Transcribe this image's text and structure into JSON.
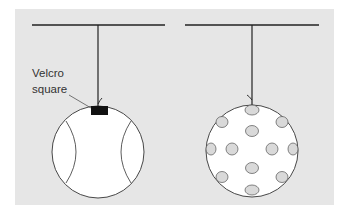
{
  "diagram": {
    "title": "",
    "panels": [
      {
        "name": "tennis-ball-pendulum",
        "ball": "tennis ball with seam curves",
        "annotation": {
          "line1": "Velcro",
          "line2": "square"
        }
      },
      {
        "name": "wiffle-ball-pendulum",
        "ball": "ball with oval holes"
      }
    ],
    "colors": {
      "background": "#e6e6e6",
      "line": "#222222",
      "ball_fill": "#ffffff",
      "hole_fill": "#d9d9d9",
      "velcro": "#111111"
    }
  }
}
